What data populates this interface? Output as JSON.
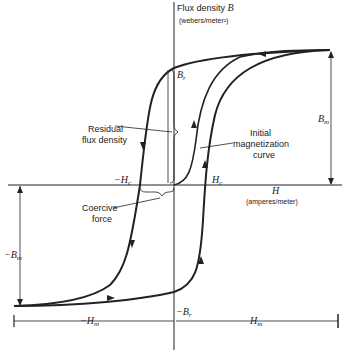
{
  "axes": {
    "y_label": "Flux density",
    "y_symbol": "B",
    "y_units": "(webers/meter²)",
    "x_symbol": "H",
    "x_units": "(amperes/meter)"
  },
  "labels": {
    "br": "B",
    "br_sub": "r",
    "neg_br": "−B",
    "hc": "H",
    "hc_sub": "c",
    "neg_hc": "−H",
    "bm": "B",
    "bm_sub": "m",
    "neg_bm": "−B",
    "hm": "H",
    "hm_sub": "m",
    "neg_hm": "−H",
    "residual_1": "Residual",
    "residual_2": "flux density",
    "coercive_1": "Coercive",
    "coercive_2": "force",
    "initial_1": "Initial",
    "initial_2": "magnetization",
    "initial_3": "curve"
  },
  "colors": {
    "ink": "#222222",
    "background": "#ffffff"
  }
}
